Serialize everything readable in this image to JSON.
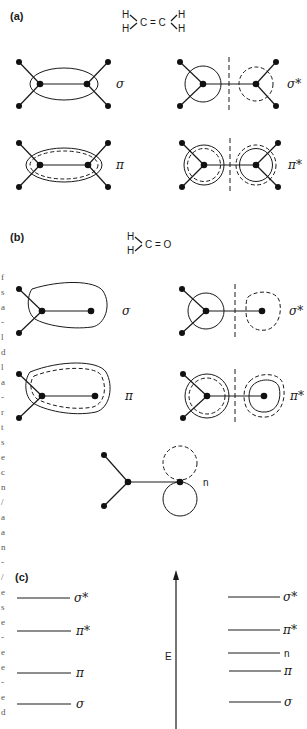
{
  "figure": {
    "panels": [
      {
        "id": "a",
        "label": "(a)",
        "molecule": "ethylene",
        "formula": {
          "left_top": "H",
          "left_bottom": "H",
          "center": "C = C",
          "right_top": "H",
          "right_bottom": "H"
        },
        "orbitals": [
          {
            "label": "σ",
            "type": "bonding"
          },
          {
            "label": "σ*",
            "type": "antibonding"
          },
          {
            "label": "π",
            "type": "bonding"
          },
          {
            "label": "π*",
            "type": "antibonding"
          }
        ]
      },
      {
        "id": "b",
        "label": "(b)",
        "molecule": "formaldehyde",
        "formula": {
          "left_top": "H",
          "left_bottom": "H",
          "center": "C = O"
        },
        "orbitals": [
          {
            "label": "σ",
            "type": "bonding"
          },
          {
            "label": "σ*",
            "type": "antibonding"
          },
          {
            "label": "π",
            "type": "bonding"
          },
          {
            "label": "π*",
            "type": "antibonding"
          },
          {
            "label": "n",
            "type": "nonbonding"
          }
        ]
      },
      {
        "id": "c",
        "label": "(c)",
        "axis_label": "E",
        "left_levels": [
          {
            "label": "σ*",
            "y": 604
          },
          {
            "label": "π*",
            "y": 637
          },
          {
            "label": "π",
            "y": 672
          },
          {
            "label": "σ",
            "y": 703
          }
        ],
        "right_levels": [
          {
            "label": "σ*",
            "y": 604
          },
          {
            "label": "π*",
            "y": 636
          },
          {
            "label": "n",
            "y": 652
          },
          {
            "label": "π",
            "y": 671
          },
          {
            "label": "σ",
            "y": 702
          }
        ]
      }
    ],
    "margin_fragments": [
      "f",
      "s",
      "a",
      "-",
      "l",
      "d",
      "l",
      "a",
      "-",
      "r",
      "t",
      "s",
      "e",
      "c",
      "n",
      "/",
      "a",
      "a",
      "n",
      "-",
      "/",
      "e",
      "s",
      "e",
      "-",
      "e",
      "e",
      "-",
      "e",
      "d",
      "n",
      "r",
      "s"
    ]
  }
}
